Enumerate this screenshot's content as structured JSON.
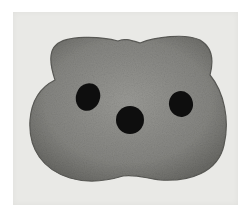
{
  "image": {
    "description": "Grayscale print of a rounded stained tissue shape with three dark holes on a light gray paper background",
    "colors": {
      "background": "#ffffff",
      "paper": "#e9e9e6",
      "shape_fill": "#8a8a86",
      "shape_edge": "#5c5c58",
      "holes": "#0e0e0e"
    }
  }
}
